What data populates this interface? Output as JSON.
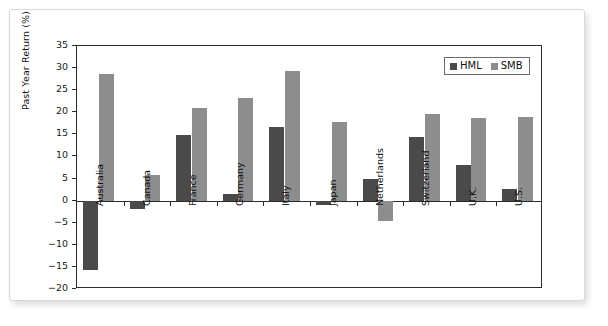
{
  "chart_data": {
    "type": "bar",
    "title": "",
    "subtitle": "",
    "xlabel": "",
    "ylabel": "Past Year Return (%)",
    "ylim": [
      -20,
      35
    ],
    "ytick_step": 5,
    "yticks": [
      "35",
      "30",
      "25",
      "20",
      "15",
      "10",
      "5",
      "0",
      "-5",
      "-10",
      "-15",
      "-20"
    ],
    "grid": false,
    "legend_position": "top-right",
    "categories": [
      "Australia",
      "Canada",
      "France",
      "Germany",
      "Italy",
      "Japan",
      "Netherlands",
      "Switzerland",
      "U.K.",
      "U.S."
    ],
    "series": [
      {
        "name": "HML",
        "color": "#4a4a4a",
        "values": [
          -15.8,
          -2.0,
          14.9,
          1.4,
          16.6,
          -1.0,
          5.0,
          14.5,
          8.1,
          2.7
        ]
      },
      {
        "name": "SMB",
        "color": "#8d8d8d",
        "values": [
          28.6,
          5.9,
          20.9,
          23.3,
          29.3,
          17.8,
          -4.5,
          19.7,
          18.7,
          19.0
        ]
      }
    ]
  },
  "legend": {
    "entries": [
      {
        "label": "HML",
        "swatch": "hml"
      },
      {
        "label": "SMB",
        "swatch": "smb"
      }
    ]
  },
  "colors": {
    "hml": "#4a4a4a",
    "smb": "#8d8d8d",
    "axis": "#2b2b2b",
    "frame": "#d8d8d8",
    "background": "#ffffff"
  }
}
